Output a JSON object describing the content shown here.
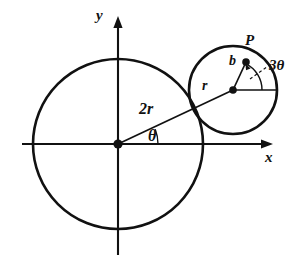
{
  "figure": {
    "background_color": "#ffffff",
    "stroke_color": "#111111",
    "axes": {
      "x_label": "x",
      "y_label": "y",
      "origin": {
        "x": 118,
        "y": 144
      },
      "x_axis": {
        "x1": 22,
        "y1": 144,
        "x2": 272,
        "y2": 144
      },
      "y_axis": {
        "x1": 118,
        "y1": 255,
        "x2": 118,
        "y2": 18
      }
    },
    "large_circle": {
      "name": "fixed-circle",
      "cx": 118,
      "cy": 144,
      "r": 85,
      "radius_label": "2r"
    },
    "small_circle": {
      "name": "rolling-circle",
      "cx": 233,
      "cy": 90,
      "r": 44,
      "radius_label": "r"
    },
    "center_line": {
      "name": "line-origin-to-rolling-center",
      "label": "2r",
      "x1": 118,
      "y1": 144,
      "x2": 233,
      "y2": 90
    },
    "rolling_radius_line": {
      "name": "line-rolling-center-to-P",
      "label": "b",
      "x1": 233,
      "y1": 90,
      "x2": 246,
      "y2": 62
    },
    "horizontal_ref_line": {
      "name": "rolling-center-horizontal-reference",
      "x1": 233,
      "y1": 90,
      "x2": 277,
      "y2": 90
    },
    "point_P": {
      "name": "point-P",
      "label": "P",
      "x": 246,
      "y": 62
    },
    "angles": [
      {
        "name": "theta-at-origin",
        "label": "θ",
        "vertex_x": 118,
        "vertex_y": 144,
        "value_text": "θ"
      },
      {
        "name": "three-theta-at-rolling-center",
        "label": "3θ",
        "vertex_x": 233,
        "vertex_y": 90,
        "value_text": "3θ"
      }
    ],
    "labels": {
      "y_axis": "y",
      "x_axis": "x",
      "big_radius": "2r",
      "theta": "θ",
      "small_radius": "r",
      "offset_b": "b",
      "point": "P",
      "three_theta": "3θ"
    },
    "leader_line": {
      "name": "dashed-leader-to-3theta",
      "style": "dashed",
      "x1": 249,
      "y1": 79,
      "x2": 272,
      "y2": 64
    }
  }
}
